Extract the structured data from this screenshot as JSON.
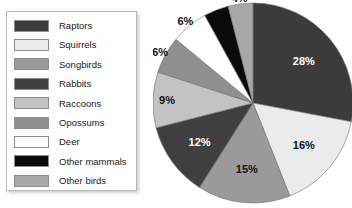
{
  "chart_data": {
    "type": "pie",
    "title": "",
    "categories": [
      "Raptors",
      "Squirrels",
      "Songbirds",
      "Rabbits",
      "Raccoons",
      "Opossums",
      "Deer",
      "Other mammals",
      "Other birds"
    ],
    "values": [
      28,
      16,
      15,
      12,
      9,
      6,
      6,
      4,
      4
    ],
    "value_labels": [
      "28%",
      "16%",
      "15%",
      "12%",
      "9%",
      "6%",
      "6%",
      "4%",
      "4%"
    ],
    "unit": "percent",
    "start_angle_deg": 0,
    "direction": "clockwise",
    "legend_position": "left",
    "grid": false,
    "colors": [
      "#3b3b3b",
      "#ebebeb",
      "#9a9a9a",
      "#3f3f3f",
      "#c3c3c3",
      "#8f8f8f",
      "#ffffff",
      "#0a0a0a",
      "#a8a8a8"
    ],
    "label_text_colors": [
      "#ffffff",
      "#111111",
      "#111111",
      "#ffffff",
      "#111111",
      "#111111",
      "#111111",
      "#ffffff",
      "#111111"
    ]
  },
  "legend": {
    "items": [
      {
        "label": "Raptors",
        "color": "#3b3b3b"
      },
      {
        "label": "Squirrels",
        "color": "#ebebeb"
      },
      {
        "label": "Songbirds",
        "color": "#9a9a9a"
      },
      {
        "label": "Rabbits",
        "color": "#3f3f3f"
      },
      {
        "label": "Raccoons",
        "color": "#c3c3c3"
      },
      {
        "label": "Opossums",
        "color": "#8f8f8f"
      },
      {
        "label": "Deer",
        "color": "#ffffff"
      },
      {
        "label": "Other mammals",
        "color": "#0a0a0a"
      },
      {
        "label": "Other birds",
        "color": "#a8a8a8"
      }
    ]
  }
}
